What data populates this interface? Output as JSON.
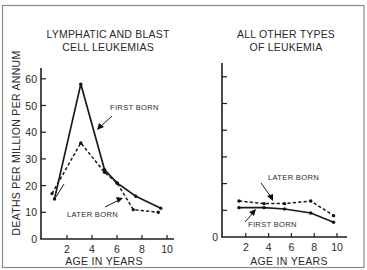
{
  "chart_data": [
    {
      "type": "line",
      "title": "LYMPHATIC AND BLAST CELL LEUKEMIAS",
      "title_lines": [
        "LYMPHATIC AND BLAST",
        "CELL LEUKEMIAS"
      ],
      "xlabel": "AGE IN YEARS",
      "ylabel": "DEATHS PER MILLION PER ANNUM",
      "xlim": [
        0,
        11
      ],
      "ylim": [
        0,
        65
      ],
      "xticks": [
        2,
        4,
        6,
        8,
        10
      ],
      "yticks": [
        0,
        10,
        20,
        30,
        40,
        50,
        60
      ],
      "grid": false,
      "series": [
        {
          "name": "FIRST BORN",
          "style": "solid",
          "x": [
            1.0,
            3.1,
            5.0,
            6.0,
            7.5,
            9.5
          ],
          "y": [
            15,
            58,
            26,
            21,
            16,
            11.5
          ]
        },
        {
          "name": "LATER BORN",
          "style": "dashed",
          "x": [
            0.8,
            3.1,
            5.0,
            6.0,
            7.3,
            9.3
          ],
          "y": [
            17,
            36,
            25,
            21,
            11,
            10
          ]
        }
      ],
      "annotations": [
        {
          "text": "FIRST BORN",
          "points_to": "solid line between ages 3 and 5"
        },
        {
          "text": "LATER BORN",
          "points_to": "dashed line near age 6"
        }
      ]
    },
    {
      "type": "line",
      "title": "ALL OTHER TYPES OF LEUKEMIA",
      "title_lines": [
        "ALL OTHER TYPES",
        "OF LEUKEMIA"
      ],
      "xlabel": "AGE IN YEARS",
      "ylabel": "",
      "xlim": [
        0,
        11
      ],
      "ylim": [
        0,
        65
      ],
      "xticks": [
        2,
        4,
        6,
        8,
        10
      ],
      "yticks": [
        0,
        10,
        20,
        30,
        40,
        50,
        60
      ],
      "ytick_labels_shown": [
        "0"
      ],
      "grid": false,
      "series": [
        {
          "name": "LATER BORN",
          "style": "dashed",
          "x": [
            1.4,
            3.6,
            5.4,
            7.7,
            9.7
          ],
          "y": [
            13.5,
            12.5,
            12.5,
            13.5,
            8
          ]
        },
        {
          "name": "FIRST BORN",
          "style": "solid",
          "x": [
            1.4,
            3.6,
            5.4,
            7.7,
            9.7
          ],
          "y": [
            11,
            11,
            10.5,
            9,
            5.5
          ]
        }
      ],
      "annotations": [
        {
          "text": "LATER BORN",
          "points_to": "dashed line near age 4.5"
        },
        {
          "text": "FIRST BORN",
          "points_to": "solid line near age 3"
        }
      ]
    }
  ],
  "labels": {
    "left_title_1": "LYMPHATIC AND BLAST",
    "left_title_2": "CELL LEUKEMIAS",
    "right_title_1": "ALL OTHER TYPES",
    "right_title_2": "OF LEUKEMIA",
    "ylabel": "DEATHS PER MILLION PER ANNUM",
    "xlabel_left": "AGE IN YEARS",
    "xlabel_right": "AGE IN YEARS",
    "left_first_born": "FIRST BORN",
    "left_later_born": "LATER BORN",
    "right_later_born": "LATER BORN",
    "right_first_born": "FIRST BORN",
    "right_zero": "0"
  },
  "colors": {
    "ink": "#1a1a1a",
    "frame": "#8a8a8a",
    "background": "#ffffff"
  }
}
